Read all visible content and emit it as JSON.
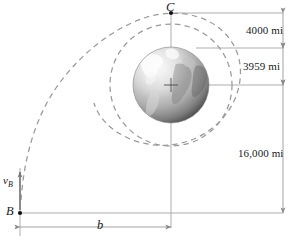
{
  "figure": {
    "name": "earth-orbit-trajectory-diagram",
    "background_color": "#ffffff"
  },
  "colors": {
    "line": "#8a8a8a",
    "dashed_curve": "#9a9a9a",
    "text": "#1a1a1a",
    "globe_dark": "#6e6e6e",
    "globe_light": "#e8e8e8",
    "globe_mid": "#b4b4b4"
  },
  "dimensions": [
    {
      "id": "alt-c",
      "label": "4000 mi",
      "value": 4000,
      "unit": "mi"
    },
    {
      "id": "radius-earth",
      "label": "3959 mi",
      "value": 3959,
      "unit": "mi"
    },
    {
      "id": "alt-b",
      "label": "16,000 mi",
      "value": 16000,
      "unit": "mi"
    },
    {
      "id": "offset-b",
      "label": "b",
      "value": null,
      "unit": ""
    }
  ],
  "points": [
    {
      "id": "C",
      "label": "C",
      "x": 171,
      "y": 13
    },
    {
      "id": "B",
      "label": "B",
      "x": 20,
      "y": 213
    }
  ],
  "vectors": [
    {
      "id": "vB",
      "label": "v",
      "subscript": "B",
      "direction": "up"
    }
  ],
  "body": {
    "name": "earth-globe",
    "center": {
      "x": 171,
      "y": 85
    },
    "radius": 38
  },
  "curves": [
    {
      "id": "trajectory",
      "style": "dashed",
      "type": "hyperbolic-approach"
    },
    {
      "id": "circular-orbit",
      "style": "dashed",
      "type": "circle"
    }
  ]
}
